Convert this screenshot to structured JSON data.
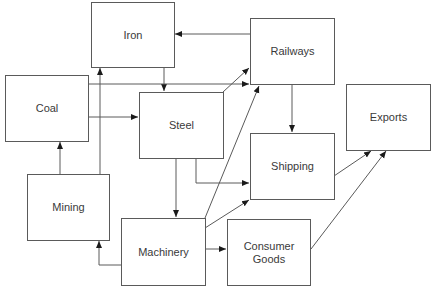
{
  "diagram": {
    "nodes": {
      "iron": {
        "label": "Iron"
      },
      "railways": {
        "label": "Railways"
      },
      "coal": {
        "label": "Coal"
      },
      "steel": {
        "label": "Steel"
      },
      "exports": {
        "label": "Exports"
      },
      "shipping": {
        "label": "Shipping"
      },
      "mining": {
        "label": "Mining"
      },
      "machinery": {
        "label": "Machinery"
      },
      "consumer_goods": {
        "label": "Consumer\nGoods"
      }
    },
    "edges": [
      {
        "from": "Railways",
        "to": "Iron"
      },
      {
        "from": "Iron",
        "to": "Steel"
      },
      {
        "from": "Coal",
        "to": "Steel"
      },
      {
        "from": "Coal",
        "to": "Railways"
      },
      {
        "from": "Mining",
        "to": "Coal"
      },
      {
        "from": "Mining",
        "to": "Iron"
      },
      {
        "from": "Steel",
        "to": "Railways"
      },
      {
        "from": "Steel",
        "to": "Shipping"
      },
      {
        "from": "Steel",
        "to": "Machinery"
      },
      {
        "from": "Railways",
        "to": "Shipping"
      },
      {
        "from": "Machinery",
        "to": "Railways"
      },
      {
        "from": "Machinery",
        "to": "Shipping"
      },
      {
        "from": "Machinery",
        "to": "Mining"
      },
      {
        "from": "Machinery",
        "to": "Consumer Goods"
      },
      {
        "from": "Shipping",
        "to": "Exports"
      },
      {
        "from": "Consumer Goods",
        "to": "Exports"
      }
    ]
  }
}
